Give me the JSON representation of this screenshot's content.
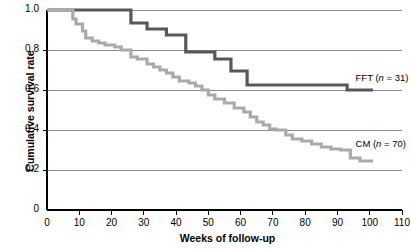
{
  "chart_data": {
    "type": "line",
    "subtype": "kaplan-meier-step",
    "title": "",
    "xlabel": "Weeks of follow-up",
    "ylabel": "Cumulative survival rate",
    "xlim": [
      0,
      110
    ],
    "ylim": [
      0,
      1.0
    ],
    "xticks": [
      0,
      10,
      20,
      30,
      40,
      50,
      60,
      70,
      80,
      90,
      100,
      110
    ],
    "xtick_labels": [
      "0",
      "10",
      "20",
      "30",
      "40",
      "50",
      "60",
      "70",
      "80",
      "90",
      "100",
      "110"
    ],
    "yticks": [
      0,
      0.2,
      0.4,
      0.6,
      0.8,
      1.0
    ],
    "ytick_labels": [
      "0",
      "0.2",
      "0.4",
      "0.6",
      "0.8",
      "1.0"
    ],
    "grid": "horizontal",
    "legend_position": "inline-right",
    "series": [
      {
        "name": "FFT",
        "n": 31,
        "label": "FFT (n = 31)",
        "color": "#585858",
        "label_x": 108,
        "label_y": 0.655,
        "x": [
          0,
          26,
          26,
          31,
          31,
          37,
          37,
          43,
          43,
          52,
          52,
          57,
          57,
          62,
          62,
          93,
          93,
          101
        ],
        "y": [
          1.0,
          1.0,
          0.935,
          0.935,
          0.905,
          0.905,
          0.875,
          0.875,
          0.79,
          0.79,
          0.755,
          0.755,
          0.695,
          0.695,
          0.625,
          0.625,
          0.6,
          0.6
        ]
      },
      {
        "name": "CM",
        "n": 70,
        "label": "CM (n = 70)",
        "color": "#aaaaaa",
        "label_x": 108,
        "label_y": 0.325,
        "x": [
          0,
          8,
          8,
          9,
          9,
          11,
          11,
          12,
          12,
          14,
          14,
          16,
          16,
          18,
          18,
          21,
          21,
          23,
          23,
          26,
          26,
          28,
          28,
          31,
          31,
          33,
          33,
          35,
          35,
          37,
          37,
          39,
          39,
          41,
          41,
          44,
          44,
          46,
          46,
          48,
          48,
          50,
          50,
          52,
          52,
          55,
          55,
          58,
          58,
          61,
          61,
          63,
          63,
          65,
          65,
          67,
          67,
          69,
          69,
          71,
          71,
          74,
          74,
          76,
          76,
          79,
          79,
          82,
          82,
          85,
          85,
          88,
          88,
          91,
          91,
          94,
          94,
          97,
          97,
          101
        ],
        "y": [
          1.0,
          1.0,
          0.955,
          0.955,
          0.93,
          0.93,
          0.895,
          0.895,
          0.86,
          0.86,
          0.845,
          0.845,
          0.835,
          0.835,
          0.825,
          0.825,
          0.815,
          0.815,
          0.8,
          0.8,
          0.765,
          0.765,
          0.755,
          0.755,
          0.73,
          0.73,
          0.715,
          0.715,
          0.7,
          0.7,
          0.685,
          0.685,
          0.665,
          0.665,
          0.645,
          0.645,
          0.635,
          0.635,
          0.62,
          0.62,
          0.6,
          0.6,
          0.575,
          0.575,
          0.555,
          0.555,
          0.535,
          0.535,
          0.51,
          0.51,
          0.49,
          0.49,
          0.465,
          0.465,
          0.44,
          0.44,
          0.425,
          0.425,
          0.405,
          0.405,
          0.4,
          0.4,
          0.375,
          0.375,
          0.355,
          0.355,
          0.345,
          0.345,
          0.33,
          0.33,
          0.315,
          0.315,
          0.305,
          0.305,
          0.3,
          0.3,
          0.26,
          0.26,
          0.245,
          0.245
        ]
      }
    ]
  },
  "axes": {
    "axis_color": "#000000",
    "grid_color": "#6d6d6d",
    "background": "#ffffff"
  }
}
